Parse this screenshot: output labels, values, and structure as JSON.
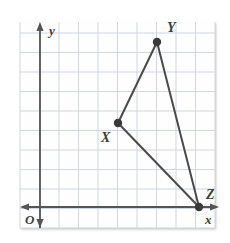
{
  "figure": {
    "background_color": "#ffffff",
    "grid": {
      "color": "#ccd4e0",
      "panel_fill": "#fefefe",
      "left": 20,
      "top": 22,
      "right": 215,
      "bottom": 228,
      "spacing": 19.5,
      "visible": true
    },
    "axes": {
      "color": "#555555",
      "y_axis": {
        "label": "y",
        "x": 40,
        "top": 24,
        "bottom": 228,
        "label_x": 49,
        "label_y": 35,
        "arrow_up": true,
        "arrow_down": true
      },
      "x_axis": {
        "label": "x",
        "y": 207,
        "left": 22,
        "right": 217,
        "label_x": 205,
        "label_y": 224,
        "arrow_left": true,
        "arrow_right": true
      },
      "origin": {
        "label": "O",
        "label_x": 25,
        "label_y": 224
      }
    },
    "shape": {
      "name": "triangle XYZ",
      "stroke_color": "#4a4a4a",
      "stroke_width": 2,
      "vertex_color": "#3a3a3a",
      "vertex_radius": 4.2,
      "vertices": [
        {
          "label": "X",
          "x": 118,
          "y": 123,
          "label_x": 101,
          "label_y": 142
        },
        {
          "label": "Y",
          "x": 157,
          "y": 42,
          "label_x": 167,
          "label_y": 32
        },
        {
          "label": "Z",
          "x": 199,
          "y": 207,
          "label_x": 206,
          "label_y": 199
        }
      ],
      "edges": [
        {
          "name": "segment-XY",
          "from": 0,
          "to": 1
        },
        {
          "name": "segment-YZ",
          "from": 1,
          "to": 2
        },
        {
          "name": "segment-ZX",
          "from": 2,
          "to": 0
        }
      ]
    }
  }
}
